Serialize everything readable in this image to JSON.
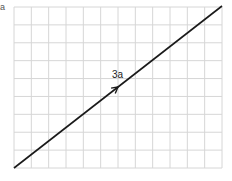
{
  "diagram": {
    "grid": {
      "cols": 12,
      "rows": 9,
      "left": 14,
      "top": 7,
      "right": 222,
      "bottom": 168,
      "line_color": "#d6d6d6"
    },
    "vector": {
      "label": "3a",
      "x1": 14,
      "y1": 168,
      "x2": 222,
      "y2": 6,
      "color": "#1a1a1a"
    },
    "corner_label": "a"
  }
}
